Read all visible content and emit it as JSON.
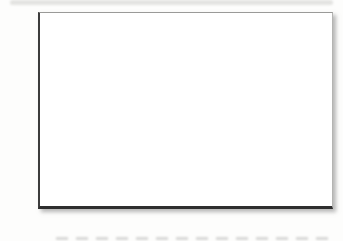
{
  "chart": {
    "ylabel": "Percent",
    "y_tick_labels": [
      "40",
      "30",
      "20",
      "10",
      "0"
    ],
    "x_labels": [
      {
        "line1": "Most of",
        "line2": "them"
      },
      {
        "line1": "Some of",
        "line2": "them"
      },
      {
        "line1": "Just one",
        "line2": ""
      },
      {
        "line1": "None",
        "line2": ""
      },
      {
        "line1": "Don't",
        "line2": "know"
      }
    ]
  },
  "chart_data": {
    "type": "bar",
    "title": "",
    "xlabel": "",
    "ylabel": "Percent",
    "categories": [
      "Most of them",
      "Some of them",
      "Just one",
      "None",
      "Don't know"
    ],
    "values": [
      21,
      23.4,
      6.4,
      17.5,
      33.5
    ],
    "ylim": [
      0,
      40
    ],
    "y_axis_ticks": [
      0,
      10,
      20,
      30,
      40
    ],
    "y_major_gridlines": [
      10,
      20,
      30
    ],
    "y_minor_gridlines": [
      5,
      15,
      25,
      35
    ],
    "grid": true,
    "legend_position": "none",
    "bar_colors": [
      "#e9e9e6",
      "#8e8e8e",
      "#e9e9e6",
      "#8e8e8e",
      "#e9e9e6"
    ]
  },
  "colors": {
    "axis": "#3c3c3c",
    "major_gridline": "#8f8f8f",
    "minor_gridline": "#e2e2e0",
    "frame": "#b4b4b2",
    "light_bar": "#e9e9e6",
    "dark_bar": "#8e8e8e",
    "text": "#2f2f2f",
    "background": "#ffffff"
  }
}
